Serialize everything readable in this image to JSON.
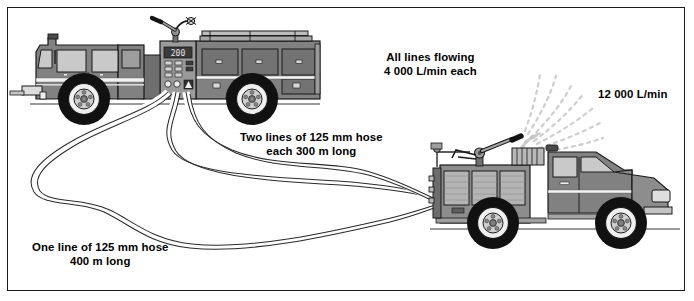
{
  "diagram": {
    "border_color": "#1a1a1a",
    "background": "#ffffff",
    "labels": {
      "all_lines_flowing": "All lines flowing\n4 000 L/min each",
      "nozzle_flow": "12 000 L/min",
      "two_lines": "Two lines of 125 mm hose\neach 300 m long",
      "one_line": "One line of 125 mm hose\n400 m long"
    },
    "values": {
      "per_line_flow": "4 000 L/min",
      "total_flow": "12 000 L/min",
      "hose_diameter": "125 mm",
      "two_line_length": "300 m",
      "one_line_length": "400 m",
      "line_count_upper": 2,
      "line_count_lower": 1
    },
    "objects": {
      "supply_engine": "fire-pumper-truck-left",
      "attack_engine": "fire-pumper-truck-right",
      "water_stream": "water-spray-fan",
      "hoses": "three-supply-hose-lines"
    },
    "colors": {
      "body": "#818181",
      "body_dark": "#5e5e5e",
      "body_light": "#a8a8a8",
      "glass": "#c9c9c9",
      "tire": "#111111",
      "rim": "#e8e8e8",
      "hose": "#ffffff",
      "hose_outline": "#2b2b2b",
      "spray": "#c2c2c2"
    }
  }
}
